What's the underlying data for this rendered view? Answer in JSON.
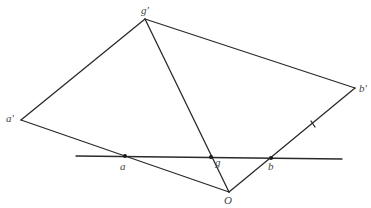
{
  "diagram": {
    "type": "geometric-construction",
    "colors": {
      "stroke": "#2a2a2a",
      "label": "#444444",
      "background": "#ffffff"
    },
    "points": {
      "g_prime": {
        "label": "g′",
        "x": 145,
        "y": 19
      },
      "a_prime": {
        "label": "a′",
        "x": 21,
        "y": 120
      },
      "b_prime": {
        "label": "b′",
        "x": 355,
        "y": 88
      },
      "O": {
        "label": "O",
        "x": 229,
        "y": 192
      },
      "a": {
        "label": "a",
        "x": 125,
        "y": 156
      },
      "g": {
        "label": "g",
        "x": 211,
        "y": 157
      },
      "b": {
        "label": "b",
        "x": 271,
        "y": 158
      }
    },
    "segments": [
      {
        "from": "a′",
        "to": "g′"
      },
      {
        "from": "g′",
        "to": "b′"
      },
      {
        "from": "g′",
        "to": "O"
      },
      {
        "from": "a′",
        "to": "O"
      },
      {
        "from": "O",
        "to": "b′"
      },
      {
        "from": "line-left",
        "to": "line-right",
        "note": "transversal line through a, g, b"
      }
    ],
    "tick_mark": {
      "on": "O–b′",
      "x": 313,
      "y": 124
    }
  }
}
